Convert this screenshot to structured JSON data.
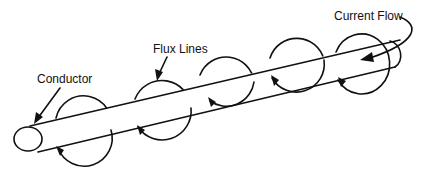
{
  "diagram": {
    "labels": {
      "conductor": "Conductor",
      "flux_lines": "Flux Lines",
      "current_flow": "Current Flow"
    },
    "colors": {
      "line": "#111111",
      "background": "#ffffff"
    },
    "flux_loop_count": 5
  }
}
